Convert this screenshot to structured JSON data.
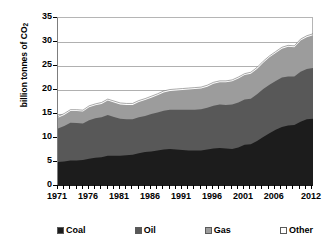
{
  "chart_data": {
    "type": "area",
    "stacked": true,
    "title": "",
    "xlabel": "",
    "ylabel": "billion tonnes of CO2",
    "ylabel_display": "billion tonnes of CO",
    "ylabel_subscript": "2",
    "ylim": [
      0,
      35
    ],
    "y_ticks": [
      0,
      5,
      10,
      15,
      20,
      25,
      30,
      35
    ],
    "xlim": [
      1971,
      2012
    ],
    "x_ticks": [
      1971,
      1976,
      1981,
      1986,
      1991,
      1996,
      2001,
      2006,
      2012
    ],
    "x_tick_labels": [
      "1971",
      "1976",
      "1981",
      "1986",
      "1991",
      "1996",
      "2001",
      "2006",
      "2012"
    ],
    "grid": "horizontal",
    "legend_position": "bottom",
    "x": [
      1971,
      1972,
      1973,
      1974,
      1975,
      1976,
      1977,
      1978,
      1979,
      1980,
      1981,
      1982,
      1983,
      1984,
      1985,
      1986,
      1987,
      1988,
      1989,
      1990,
      1991,
      1992,
      1993,
      1994,
      1995,
      1996,
      1997,
      1998,
      1999,
      2000,
      2001,
      2002,
      2003,
      2004,
      2005,
      2006,
      2007,
      2008,
      2009,
      2010,
      2011,
      2012
    ],
    "series": [
      {
        "name": "Coal",
        "color": "#1c1c1c",
        "values": [
          5.0,
          5.1,
          5.3,
          5.3,
          5.4,
          5.7,
          5.9,
          6.0,
          6.3,
          6.3,
          6.3,
          6.4,
          6.5,
          6.8,
          7.1,
          7.2,
          7.4,
          7.6,
          7.7,
          7.6,
          7.5,
          7.4,
          7.4,
          7.4,
          7.6,
          7.8,
          7.9,
          7.8,
          7.7,
          8.0,
          8.6,
          8.7,
          9.4,
          10.2,
          11.0,
          11.7,
          12.3,
          12.6,
          12.7,
          13.4,
          13.9,
          14.0
        ]
      },
      {
        "name": "Oil",
        "color": "#585858",
        "values": [
          7.0,
          7.4,
          7.9,
          7.8,
          7.6,
          8.0,
          8.2,
          8.3,
          8.5,
          8.1,
          7.7,
          7.5,
          7.4,
          7.5,
          7.5,
          7.8,
          7.9,
          8.1,
          8.2,
          8.3,
          8.4,
          8.5,
          8.5,
          8.6,
          8.7,
          8.9,
          9.1,
          9.1,
          9.3,
          9.4,
          9.4,
          9.5,
          9.7,
          10.0,
          10.1,
          10.2,
          10.3,
          10.2,
          10.1,
          10.4,
          10.5,
          10.6
        ]
      },
      {
        "name": "Gas",
        "color": "#9c9c9c",
        "values": [
          2.2,
          2.3,
          2.4,
          2.5,
          2.5,
          2.7,
          2.7,
          2.8,
          3.0,
          3.0,
          3.0,
          3.0,
          3.0,
          3.2,
          3.3,
          3.4,
          3.6,
          3.8,
          3.9,
          4.0,
          4.1,
          4.2,
          4.3,
          4.3,
          4.4,
          4.6,
          4.6,
          4.7,
          4.8,
          5.0,
          5.1,
          5.2,
          5.3,
          5.5,
          5.7,
          5.8,
          6.0,
          6.2,
          6.1,
          6.5,
          6.6,
          6.8
        ]
      },
      {
        "name": "Other",
        "color": "#ffffff",
        "values": [
          0.3,
          0.3,
          0.3,
          0.3,
          0.3,
          0.3,
          0.3,
          0.3,
          0.3,
          0.3,
          0.3,
          0.3,
          0.3,
          0.3,
          0.3,
          0.3,
          0.3,
          0.3,
          0.3,
          0.3,
          0.3,
          0.3,
          0.3,
          0.3,
          0.3,
          0.3,
          0.3,
          0.3,
          0.3,
          0.3,
          0.3,
          0.3,
          0.3,
          0.3,
          0.3,
          0.3,
          0.3,
          0.3,
          0.3,
          0.3,
          0.3,
          0.3
        ]
      }
    ],
    "totals": [
      14.5,
      15.1,
      15.9,
      15.9,
      15.8,
      16.7,
      17.1,
      17.4,
      18.1,
      17.7,
      17.3,
      17.2,
      17.2,
      17.8,
      18.2,
      18.7,
      19.2,
      19.8,
      20.1,
      20.2,
      20.3,
      20.4,
      20.5,
      20.6,
      21.0,
      21.6,
      21.9,
      21.9,
      22.1,
      22.7,
      23.4,
      23.7,
      24.7,
      26.0,
      27.1,
      28.0,
      28.9,
      29.3,
      29.2,
      30.6,
      31.3,
      31.7
    ]
  },
  "legend": {
    "entries": [
      {
        "label": "Coal",
        "color": "#1c1c1c"
      },
      {
        "label": "Oil",
        "color": "#585858"
      },
      {
        "label": "Gas",
        "color": "#9c9c9c"
      },
      {
        "label": "Other",
        "color": "#ffffff"
      }
    ]
  }
}
